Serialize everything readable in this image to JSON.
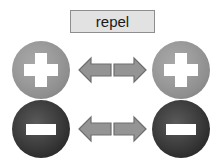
{
  "diagram": {
    "title": "repel",
    "background_color": "#ffffff",
    "label": {
      "text": "repel",
      "fill_color": "#e2e2e2",
      "border_color": "#8e8e8e"
    },
    "colors": {
      "positive_charge": "#9c9c9c",
      "negative_charge": "#2a2a2a",
      "arrow": "#949494",
      "arrow_outline": "#6e6e6e",
      "glyph": "#ffffff"
    },
    "rows": [
      {
        "row_label": "positive-positive",
        "left_charge": {
          "sign": "+",
          "type": "positive",
          "glyph": "plus-icon"
        },
        "right_charge": {
          "sign": "+",
          "type": "positive",
          "glyph": "plus-icon"
        },
        "left_arrow": {
          "direction": "left",
          "glyph": "arrow-left-icon"
        },
        "right_arrow": {
          "direction": "right",
          "glyph": "arrow-right-icon"
        }
      },
      {
        "row_label": "negative-negative",
        "left_charge": {
          "sign": "-",
          "type": "negative",
          "glyph": "minus-icon"
        },
        "right_charge": {
          "sign": "-",
          "type": "negative",
          "glyph": "minus-icon"
        },
        "left_arrow": {
          "direction": "left",
          "glyph": "arrow-left-icon"
        },
        "right_arrow": {
          "direction": "right",
          "glyph": "arrow-right-icon"
        }
      }
    ]
  }
}
